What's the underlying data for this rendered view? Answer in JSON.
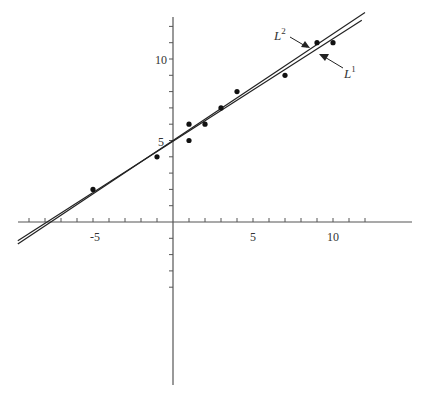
{
  "chart_data": {
    "type": "scatter",
    "title": "",
    "xlabel": "",
    "ylabel": "",
    "xlim": [
      -9.5,
      14.8
    ],
    "ylim": [
      -10,
      12.5
    ],
    "grid": false,
    "x_tick_labels": [
      "-5",
      "5",
      "10"
    ],
    "y_tick_labels": [
      "5",
      "10"
    ],
    "points": [
      {
        "x": -5,
        "y": 2
      },
      {
        "x": -1,
        "y": 4
      },
      {
        "x": 1,
        "y": 6
      },
      {
        "x": 1,
        "y": 5
      },
      {
        "x": 2,
        "y": 6
      },
      {
        "x": 3,
        "y": 7
      },
      {
        "x": 4,
        "y": 8
      },
      {
        "x": 7,
        "y": 9
      },
      {
        "x": 9,
        "y": 11
      },
      {
        "x": 10,
        "y": 11
      }
    ],
    "series": [
      {
        "name": "L1",
        "label_base": "L",
        "label_sup": "1",
        "type": "line",
        "slope": 0.629,
        "intercept": 4.95,
        "x_range": [
          -9.7,
          11.8
        ]
      },
      {
        "name": "L2",
        "label_base": "L",
        "label_sup": "2",
        "type": "line",
        "slope": 0.655,
        "intercept": 5.0,
        "x_range": [
          -9.7,
          12.0
        ]
      }
    ],
    "annotations": [
      {
        "text": "L2",
        "target": "L2",
        "label_pos": [
          6.6,
          11.5
        ],
        "arrow_to": [
          8.3,
          10.5
        ]
      },
      {
        "text": "L1",
        "target": "L1",
        "label_pos": [
          10.7,
          9.5
        ],
        "arrow_to": [
          8.8,
          10.6
        ]
      }
    ]
  },
  "labels": {
    "x_neg5": "-5",
    "x_5": "5",
    "x_10": "10",
    "y_5": "5",
    "y_10": "10",
    "L_base": "L",
    "L1_sup": "1",
    "L2_sup": "2"
  }
}
